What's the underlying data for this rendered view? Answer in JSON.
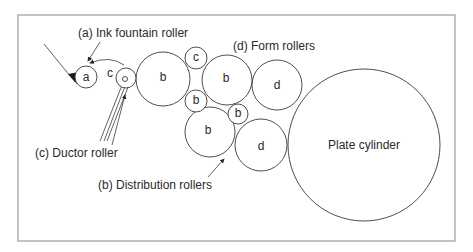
{
  "diagram": {
    "labels": {
      "ink_fountain": "(a) Ink fountain roller",
      "form_rollers": "(d) Form rollers",
      "ductor": "(c) Ductor roller",
      "distribution": "(b) Distribution rollers",
      "plate_cylinder": "Plate cylinder"
    },
    "rollers": [
      {
        "id": "a",
        "letter": "a",
        "role": "ink-fountain-roller",
        "cx": 86,
        "cy": 77,
        "r": 11
      },
      {
        "id": "c",
        "letter": "c",
        "role": "ductor-roller",
        "cx": 126,
        "cy": 78,
        "r": 10
      },
      {
        "id": "b1",
        "letter": "b",
        "role": "distribution-roller",
        "cx": 163,
        "cy": 79,
        "r": 27
      },
      {
        "id": "b2",
        "letter": "b",
        "role": "distribution-roller",
        "cx": 196,
        "cy": 58,
        "r": 11
      },
      {
        "id": "b3",
        "letter": "b",
        "role": "distribution-roller",
        "cx": 196,
        "cy": 101,
        "r": 11
      },
      {
        "id": "b4",
        "letter": "b",
        "role": "distribution-roller",
        "cx": 227,
        "cy": 80,
        "r": 25
      },
      {
        "id": "b5",
        "letter": "b",
        "role": "distribution-roller",
        "cx": 238,
        "cy": 114,
        "r": 10
      },
      {
        "id": "b6",
        "letter": "b",
        "role": "distribution-roller",
        "cx": 210,
        "cy": 132,
        "r": 25
      },
      {
        "id": "d1",
        "letter": "d",
        "role": "form-roller",
        "cx": 277,
        "cy": 85,
        "r": 25
      },
      {
        "id": "d2",
        "letter": "d",
        "role": "form-roller",
        "cx": 261,
        "cy": 145,
        "r": 26
      }
    ],
    "plate_cylinder": {
      "cx": 364,
      "cy": 145,
      "r": 76
    },
    "colors": {
      "stroke": "#3a3a3a",
      "frame": "#9a9a9a",
      "text": "#2a2a2a",
      "background": "#ffffff"
    }
  }
}
